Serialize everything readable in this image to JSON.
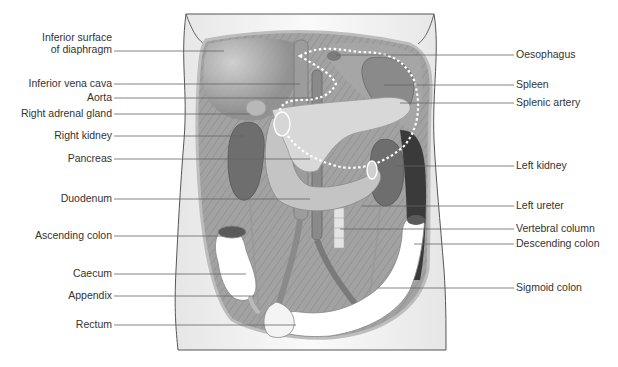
{
  "diagram": {
    "left_labels": [
      {
        "text": "Inferior surface",
        "text2": "of diaphragm",
        "y": 51
      },
      {
        "text": "Inferior vena cava",
        "y": 84
      },
      {
        "text": "Aorta",
        "y": 98
      },
      {
        "text": "Right adrenal gland",
        "y": 114
      },
      {
        "text": "Right kidney",
        "y": 136
      },
      {
        "text": "Pancreas",
        "y": 159
      },
      {
        "text": "Duodenum",
        "y": 199
      },
      {
        "text": "Ascending colon",
        "y": 236
      },
      {
        "text": "Caecum",
        "y": 274
      },
      {
        "text": "Appendix",
        "y": 296
      },
      {
        "text": "Rectum",
        "y": 325
      }
    ],
    "right_labels": [
      {
        "text": "Oesophagus",
        "y": 55
      },
      {
        "text": "Spleen",
        "y": 85
      },
      {
        "text": "Splenic artery",
        "y": 103
      },
      {
        "text": "Left kidney",
        "y": 166
      },
      {
        "text": "Left ureter",
        "y": 206
      },
      {
        "text": "Vertebral column",
        "y": 229
      },
      {
        "text": "Descending colon",
        "y": 244
      },
      {
        "text": "Sigmoid colon",
        "y": 288
      }
    ],
    "colors": {
      "skin": "#f1f1f1",
      "outline": "#444444",
      "muscle": "#9a9a9a",
      "kidney": "#6e6e6e",
      "pancreas": "#cfcfcf",
      "colon": "#ffffff",
      "dark_cavity": "#3a3a3a",
      "leader": "#666666",
      "text": "#333333"
    }
  }
}
